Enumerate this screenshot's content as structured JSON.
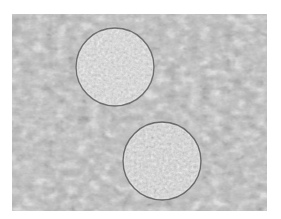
{
  "image": {
    "description": "Grayscale brightfield micrograph showing two round cells on a textured background",
    "alt": "Two spherical cells under a microscope",
    "frame": {
      "x": 12,
      "y": 14,
      "width": 255,
      "height": 197
    },
    "background_tone": "#b9b9b9",
    "cells": [
      {
        "label": "upper cell",
        "cx": 115,
        "cy": 67,
        "r": 39
      },
      {
        "label": "lower cell",
        "cx": 162,
        "cy": 161,
        "r": 39
      }
    ]
  }
}
